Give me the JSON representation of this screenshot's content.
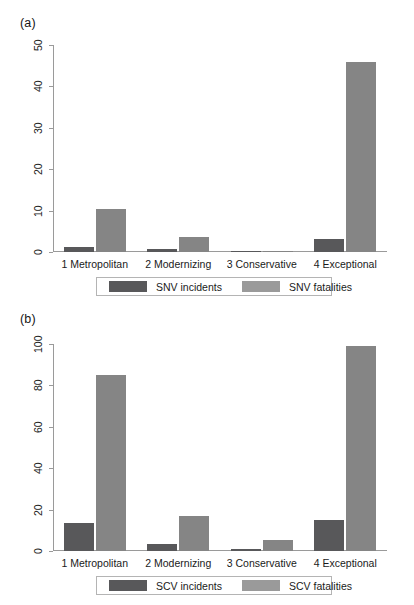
{
  "figure": {
    "panels": [
      {
        "tag": "(a)",
        "chart_data": {
          "type": "bar",
          "title": "",
          "subtitle": "",
          "xlabel": "",
          "ylabel": "",
          "ylim": [
            0,
            50
          ],
          "yticks": [
            0,
            10,
            20,
            30,
            40,
            50
          ],
          "ytick_labels": [
            "0",
            "10",
            "20",
            "30",
            "40",
            "50"
          ],
          "grid": false,
          "legend_position": "bottom",
          "categories": [
            "1 Metropolitan",
            "2 Modernizing",
            "3 Conservative",
            "4 Exceptional"
          ],
          "series": [
            {
              "name": "SNV incidents",
              "color": "#58585a",
              "values": [
                1.3,
                0.8,
                0.15,
                3.1
              ]
            },
            {
              "name": "SNV fatalities",
              "color": "#858585",
              "values": [
                10.4,
                3.7,
                0.3,
                46.0
              ]
            }
          ]
        }
      },
      {
        "tag": "(b)",
        "chart_data": {
          "type": "bar",
          "title": "",
          "subtitle": "",
          "xlabel": "",
          "ylabel": "",
          "ylim": [
            0,
            100
          ],
          "yticks": [
            0,
            20,
            40,
            60,
            80,
            100
          ],
          "ytick_labels": [
            "0",
            "20",
            "40",
            "60",
            "80",
            "100"
          ],
          "grid": false,
          "legend_position": "bottom",
          "categories": [
            "1 Metropolitan",
            "2 Modernizing",
            "3 Conservative",
            "4 Exceptional"
          ],
          "series": [
            {
              "name": "SCV incidents",
              "color": "#58585a",
              "values": [
                13.5,
                3.2,
                1.2,
                14.8
              ]
            },
            {
              "name": "SCV fatalities",
              "color": "#858585",
              "values": [
                85.0,
                17.0,
                5.3,
                99.0
              ]
            }
          ]
        }
      }
    ]
  }
}
